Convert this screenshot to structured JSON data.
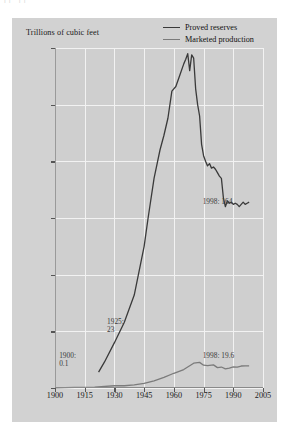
{
  "top_artifact": {
    "ghost_text": "|| ||"
  },
  "axis_title": "Trillions of cubic feet",
  "legend": {
    "position": "top-right",
    "items": [
      {
        "label": "Proved reserves",
        "color": "#3a3a3a",
        "name": "proved-reserves"
      },
      {
        "label": "Marketed production",
        "color": "#7b7b7b",
        "name": "marketed-production"
      }
    ]
  },
  "annotations": [
    {
      "id": "a1900",
      "text_line1": "1900:",
      "text_line2": "0.1",
      "x_pct": 2.0,
      "y_px": 352
    },
    {
      "id": "a1925",
      "text_line1": "1925:",
      "text_line2": "23",
      "x_pct": 25.0,
      "y_px": 318
    },
    {
      "id": "r1998",
      "text_line1": "1998: 164",
      "text_line2": "",
      "x_pct": 71.0,
      "y_px": 198
    },
    {
      "id": "p1998",
      "text_line1": "1998: 19.6",
      "text_line2": "",
      "x_pct": 71.0,
      "y_px": 352
    }
  ],
  "chart_data": {
    "type": "line",
    "title": "",
    "xlabel": "",
    "ylabel": "Trillions of cubic feet",
    "xlim": [
      1900,
      2005
    ],
    "ylim": [
      0,
      300
    ],
    "yticks": [
      0,
      50,
      100,
      150,
      200,
      250,
      300
    ],
    "xticks": [
      1900,
      1915,
      1930,
      1945,
      1960,
      1975,
      1990,
      2005
    ],
    "grid": true,
    "legend_position": "top-right",
    "series": [
      {
        "name": "Proved reserves",
        "color": "#3a3a3a",
        "x": [
          1922,
          1925,
          1930,
          1935,
          1940,
          1945,
          1947,
          1950,
          1953,
          1955,
          1957,
          1959,
          1961,
          1963,
          1965,
          1966,
          1967,
          1968,
          1969,
          1970,
          1971,
          1972,
          1973,
          1974,
          1975,
          1976,
          1977,
          1978,
          1979,
          1980,
          1981,
          1982,
          1983,
          1984,
          1985,
          1986,
          1987,
          1988,
          1989,
          1990,
          1991,
          1992,
          1993,
          1994,
          1995,
          1996,
          1997,
          1998
        ],
        "y": [
          14,
          23,
          40,
          58,
          82,
          125,
          150,
          185,
          210,
          223,
          238,
          262,
          266,
          276,
          286,
          290,
          295,
          280,
          294,
          291,
          264,
          250,
          240,
          215,
          205,
          200,
          196,
          198,
          194,
          195,
          193,
          190,
          187,
          185,
          168,
          160,
          165,
          163,
          164,
          162,
          163,
          162,
          160,
          162,
          164,
          162,
          163,
          164
        ]
      },
      {
        "name": "Marketed production",
        "color": "#7b7b7b",
        "x": [
          1900,
          1910,
          1920,
          1930,
          1935,
          1940,
          1945,
          1950,
          1955,
          1960,
          1965,
          1970,
          1973,
          1975,
          1977,
          1980,
          1982,
          1984,
          1986,
          1988,
          1990,
          1992,
          1994,
          1996,
          1998
        ],
        "y": [
          0.1,
          0.5,
          0.8,
          2.0,
          2.0,
          2.7,
          4.0,
          6.3,
          9.4,
          13.0,
          16.3,
          21.9,
          22.6,
          20.1,
          19.7,
          20.4,
          18.0,
          18.5,
          16.9,
          17.6,
          18.6,
          18.4,
          19.4,
          19.5,
          19.6
        ]
      }
    ],
    "callouts": [
      {
        "series": "Marketed production",
        "year": 1900,
        "value": 0.1,
        "label": "1900: 0.1"
      },
      {
        "series": "Proved reserves",
        "year": 1925,
        "value": 23,
        "label": "1925: 23"
      },
      {
        "series": "Proved reserves",
        "year": 1998,
        "value": 164,
        "label": "1998: 164"
      },
      {
        "series": "Marketed production",
        "year": 1998,
        "value": 19.6,
        "label": "1998: 19.6"
      }
    ]
  }
}
